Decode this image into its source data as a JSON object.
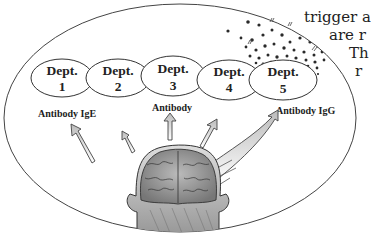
{
  "page_text": {
    "line1": "trigger a",
    "line2": "are r",
    "line3": "Th",
    "line4": "r"
  },
  "diagram": {
    "departments": [
      {
        "title": "Dept.",
        "number": "1"
      },
      {
        "title": "Dept.",
        "number": "2"
      },
      {
        "title": "Dept.",
        "number": "3"
      },
      {
        "title": "Dept.",
        "number": "4"
      },
      {
        "title": "Dept.",
        "number": "5"
      }
    ],
    "antibody_labels": {
      "left": "Antibody IgE",
      "center": "Antibody",
      "right": "Antibody IgG"
    },
    "colors": {
      "line": "#333333",
      "particles": "#2a2a2a",
      "brain_fill": "#9a9a9a",
      "head_fill": "#c8c8c8"
    }
  }
}
